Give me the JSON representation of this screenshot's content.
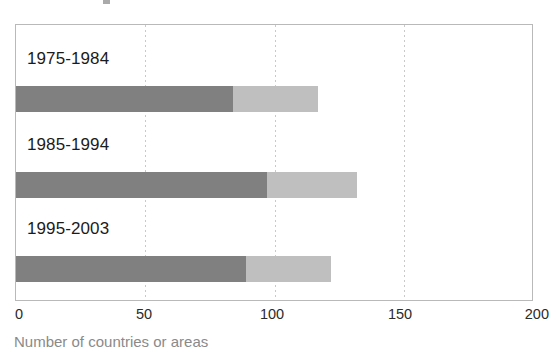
{
  "chart_data": {
    "type": "bar",
    "orientation": "horizontal",
    "stacked": true,
    "title": "",
    "subtitle": "",
    "xlabel": "Number of countries or areas",
    "ylabel": "",
    "xlim": [
      0,
      200
    ],
    "xticks": [
      0,
      50,
      100,
      150,
      200
    ],
    "xtick_labels": [
      "0",
      "50",
      "100",
      "150",
      "200"
    ],
    "grid": "vertical-dotted",
    "legend": "none",
    "categories": [
      "1975-1984",
      "1985-1994",
      "1995-2003"
    ],
    "series": [
      {
        "name": "segment-1",
        "color": "#808080",
        "values": [
          84,
          97,
          89
        ]
      },
      {
        "name": "segment-2",
        "color": "#bfbfbf",
        "values": [
          33,
          35,
          33
        ]
      }
    ],
    "totals": [
      117,
      132,
      122
    ],
    "annotations": []
  },
  "axis": {
    "caption": "Number of countries or areas",
    "ticks": [
      {
        "label": "0",
        "value": 0
      },
      {
        "label": "50",
        "value": 50
      },
      {
        "label": "100",
        "value": 100
      },
      {
        "label": "150",
        "value": 150
      },
      {
        "label": "200",
        "value": 200
      }
    ]
  },
  "colors": {
    "segment_dark": "#808080",
    "segment_light": "#bfbfbf",
    "frame": "#b9b9b9",
    "gridline": "#c9c9c9",
    "label_text": "#1b1b1b",
    "tick_text": "#2b2b2b",
    "caption_text": "#8a8a8a",
    "background": "#ffffff"
  },
  "bars": [
    {
      "label": "1975-1984",
      "dark": 84,
      "light": 33,
      "total": 117
    },
    {
      "label": "1985-1994",
      "dark": 97,
      "light": 35,
      "total": 132
    },
    {
      "label": "1995-2003",
      "dark": 89,
      "light": 33,
      "total": 122
    }
  ]
}
